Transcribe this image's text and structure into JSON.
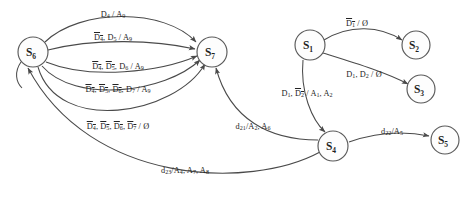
{
  "diagram": {
    "type": "state-machine",
    "colors": {
      "stroke": "#4a4a4a",
      "node_stroke": "#5a5a5a",
      "node_fill": "#fdfdfd",
      "text": "#232323",
      "background": "#ffffff"
    },
    "nodes": [
      {
        "id": "S6",
        "label": "S",
        "sub": "6",
        "cx": 33,
        "cy": 52,
        "r": 15
      },
      {
        "id": "S7",
        "label": "S",
        "sub": "7",
        "cx": 212,
        "cy": 52,
        "r": 15
      },
      {
        "id": "S1",
        "label": "S",
        "sub": "1",
        "cx": 310,
        "cy": 45,
        "r": 15
      },
      {
        "id": "S2",
        "label": "S",
        "sub": "2",
        "cx": 416,
        "cy": 45,
        "r": 14
      },
      {
        "id": "S3",
        "label": "S",
        "sub": "3",
        "cx": 421,
        "cy": 89,
        "r": 14
      },
      {
        "id": "S4",
        "label": "S",
        "sub": "4",
        "cx": 333,
        "cy": 146,
        "r": 15
      },
      {
        "id": "S5",
        "label": "S",
        "sub": "5",
        "cx": 445,
        "cy": 140,
        "r": 14
      }
    ],
    "edges": [
      {
        "from": "S6",
        "to": "S7",
        "label_html": "D<sub>4</sub> / A<sub>9</sub>",
        "label_text": "D4 / A9",
        "x": 113,
        "y": 10
      },
      {
        "from": "S6",
        "to": "S7",
        "label_html": "<span class=\"ovl\">D<sub>4</sub></span>, D<sub>5</sub> / A<sub>9</sub>",
        "label_text": "!D4, D5 / A9",
        "x": 113,
        "y": 33
      },
      {
        "from": "S6",
        "to": "S7",
        "label_html": "<span class=\"ovl\">D<sub>4</sub></span>, <span class=\"ovl\">D<sub>5</sub></span>, D<sub>6</sub> / A<sub>9</sub>",
        "label_text": "!D4, !D5, D6 / A9",
        "x": 118,
        "y": 62
      },
      {
        "from": "S6",
        "to": "S7",
        "label_html": "<span class=\"ovl\">D<sub>4</sub></span>, <span class=\"ovl\">D<sub>5</sub></span>, <span class=\"ovl\">D<sub>6</sub></span>, D<sub>7</sub> / A<sub>9</sub>",
        "label_text": "!D4, !D5, !D6, D7 / A9",
        "x": 118,
        "y": 85
      },
      {
        "from": "S6",
        "to": "S7",
        "label_html": "<span class=\"ovl\">D<sub>4</sub></span>, <span class=\"ovl\">D<sub>5</sub></span>, <span class=\"ovl\">D<sub>6</sub></span>, <span class=\"ovl\">D<sub>7</sub></span> / Ø",
        "label_text": "!D4, !D5, !D6, !D7 / 0",
        "x": 118,
        "y": 122
      },
      {
        "from": "S1",
        "to": "S2",
        "label_html": "<span class=\"ovl\">D<sub>1</sub></span> / Ø",
        "label_text": "!D1 / 0",
        "x": 357,
        "y": 19
      },
      {
        "from": "S1",
        "to": "S3",
        "label_html": "D<sub>1</sub>, D<sub>2</sub> / Ø",
        "label_text": "D1, D2 / 0",
        "x": 364,
        "y": 70
      },
      {
        "from": "S1",
        "to": "S4",
        "label_html": "D<sub>1</sub>, <span class=\"ovl\">D<sub>2</sub></span> / A<sub>1</sub>, A<sub>2</sub>",
        "label_text": "D1, !D2 / A1, A2",
        "x": 307,
        "y": 89
      },
      {
        "from": "S4",
        "to": "S7",
        "label_html": "d<sub>21</sub>/A<sub>2</sub>, A<sub>6</sub>",
        "label_text": "d21 / A2, A6",
        "x": 253,
        "y": 122
      },
      {
        "from": "S4",
        "to": "S5",
        "label_html": "d<sub>22</sub>/A<sub>5</sub>",
        "label_text": "d22 / A5",
        "x": 392,
        "y": 127
      },
      {
        "from": "S4",
        "to": "S6",
        "label_html": "d<sub>23</sub>/A<sub>4</sub>, A<sub>7</sub>, A<sub>8</sub>",
        "label_text": "d23 / A4, A7, A8",
        "x": 185,
        "y": 166
      }
    ]
  }
}
